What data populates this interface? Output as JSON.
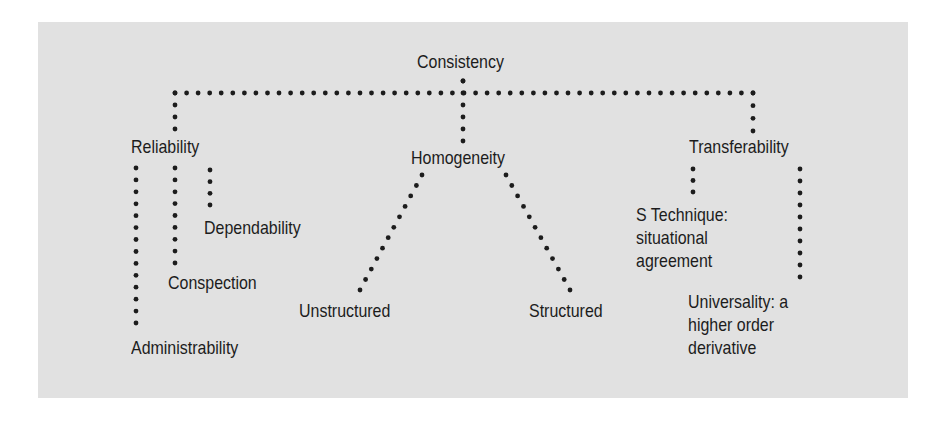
{
  "diagram": {
    "type": "hierarchy-tree",
    "colors": {
      "panel_background": "#e1e1e1",
      "text": "#1c1c1c",
      "dots": "#1c1c1c"
    },
    "root": {
      "label": "Consistency"
    },
    "branches": [
      {
        "label": "Reliability",
        "children": [
          {
            "label": "Dependability"
          },
          {
            "label": "Conspection"
          },
          {
            "label": "Administrability"
          }
        ]
      },
      {
        "label": "Homogeneity",
        "children": [
          {
            "label": "Unstructured"
          },
          {
            "label": "Structured"
          }
        ]
      },
      {
        "label": "Transferability",
        "children": [
          {
            "lines": [
              "S Technique:",
              "situational",
              "agreement"
            ]
          },
          {
            "lines": [
              "Universality: a",
              "higher order",
              "derivative"
            ]
          }
        ]
      }
    ]
  }
}
